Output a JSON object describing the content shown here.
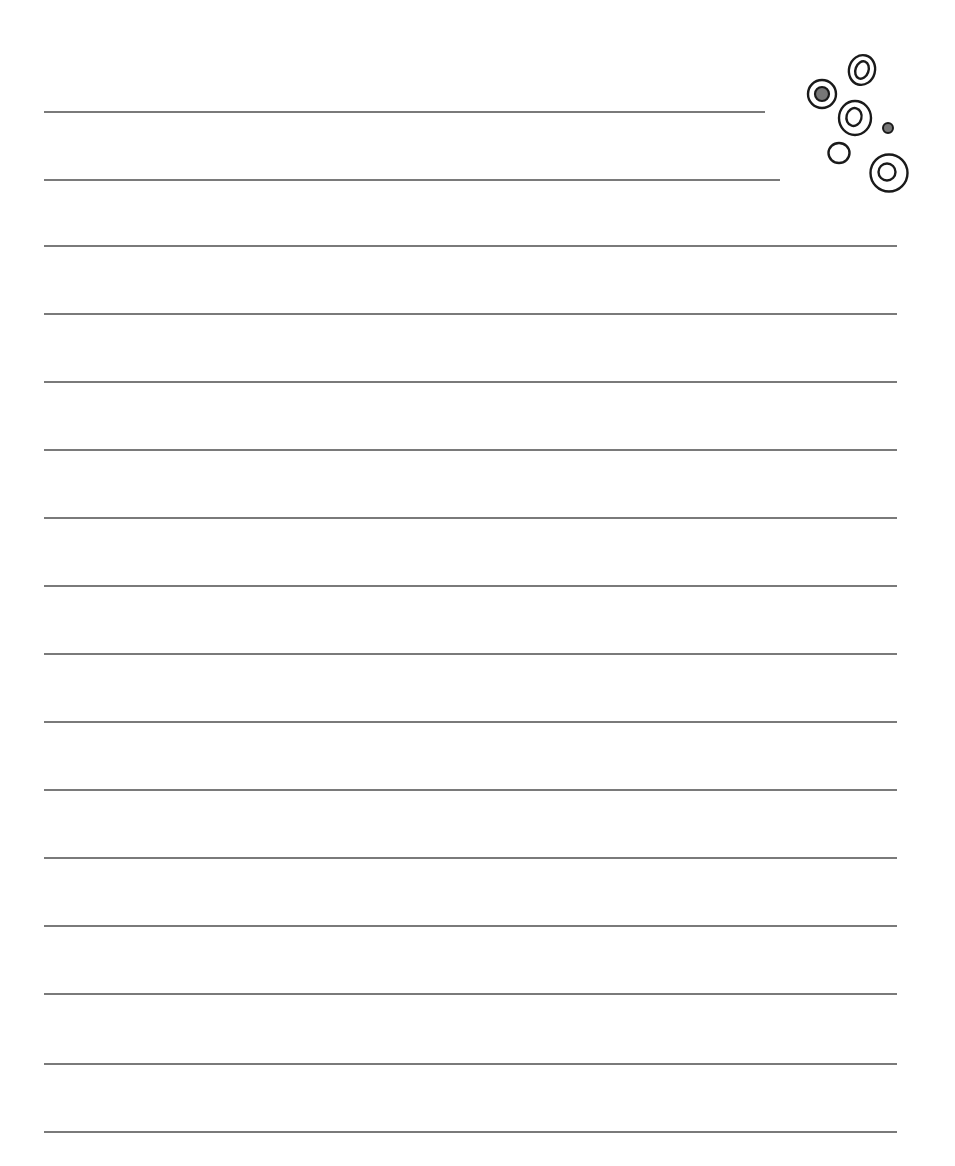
{
  "page": {
    "type": "lined-paper",
    "background": "#ffffff",
    "line_color": "#7a7a7a",
    "lines": [
      {
        "y": 111,
        "x1": 44,
        "x2": 765
      },
      {
        "y": 179,
        "x1": 44,
        "x2": 780
      },
      {
        "y": 245,
        "x1": 44,
        "x2": 897
      },
      {
        "y": 313,
        "x1": 44,
        "x2": 897
      },
      {
        "y": 381,
        "x1": 44,
        "x2": 897
      },
      {
        "y": 449,
        "x1": 44,
        "x2": 897
      },
      {
        "y": 517,
        "x1": 44,
        "x2": 897
      },
      {
        "y": 585,
        "x1": 44,
        "x2": 897
      },
      {
        "y": 653,
        "x1": 44,
        "x2": 897
      },
      {
        "y": 721,
        "x1": 44,
        "x2": 897
      },
      {
        "y": 789,
        "x1": 44,
        "x2": 897
      },
      {
        "y": 857,
        "x1": 44,
        "x2": 897
      },
      {
        "y": 925,
        "x1": 44,
        "x2": 897
      },
      {
        "y": 993,
        "x1": 44,
        "x2": 897
      },
      {
        "y": 1063,
        "x1": 44,
        "x2": 897
      },
      {
        "y": 1131,
        "x1": 44,
        "x2": 897
      }
    ]
  },
  "decoration": {
    "stroke_color": "#1a1a1a",
    "fill_color": "#777777",
    "circles": [
      {
        "name": "top-oval-ring",
        "cx": 862,
        "cy": 70,
        "rx": 13,
        "ry": 15,
        "inner_rx": 7,
        "inner_ry": 9,
        "filled": false
      },
      {
        "name": "left-filled-ring",
        "cx": 822,
        "cy": 94,
        "r": 15,
        "inner_r": 6,
        "filled": true
      },
      {
        "name": "middle-ring",
        "cx": 855,
        "cy": 118,
        "r": 17,
        "inner_r": 8,
        "filled": false
      },
      {
        "name": "small-dot",
        "cx": 888,
        "cy": 128,
        "r": 5,
        "filled": true
      },
      {
        "name": "small-plain-circle",
        "cx": 839,
        "cy": 153,
        "r": 10,
        "filled": false
      },
      {
        "name": "bottom-ring",
        "cx": 889,
        "cy": 173,
        "r": 19,
        "inner_r": 9,
        "filled": false
      }
    ]
  }
}
